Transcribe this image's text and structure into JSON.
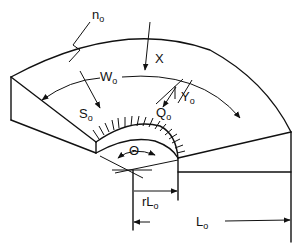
{
  "diagram": {
    "type": "geometry-schematic",
    "labels": {
      "n0": {
        "main": "n",
        "sub": "o"
      },
      "X": {
        "main": "X",
        "sub": ""
      },
      "W0": {
        "main": "W",
        "sub": "o"
      },
      "S0": {
        "main": "S",
        "sub": "o"
      },
      "Y0": {
        "main": "Y",
        "sub": "o"
      },
      "Q0": {
        "main": "Q",
        "sub": "o"
      },
      "theta": {
        "main": "Θ",
        "sub": ""
      },
      "rL0": {
        "main": "rL",
        "sub": "o"
      },
      "L0": {
        "main": "L",
        "sub": "o"
      }
    },
    "colors": {
      "line": "#111111",
      "background": "#ffffff"
    }
  }
}
